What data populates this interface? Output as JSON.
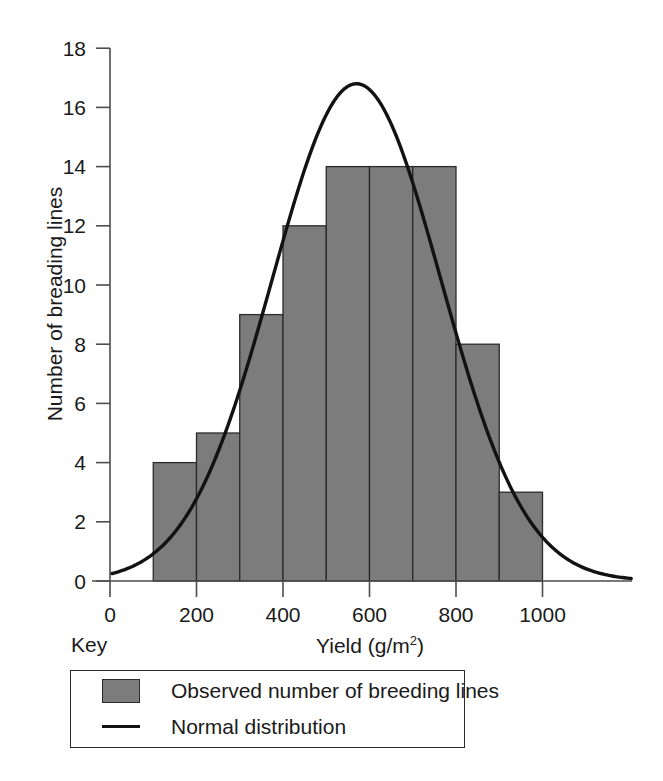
{
  "chart_data": {
    "type": "bar",
    "title": "",
    "subtitle": "",
    "xlabel": "Yield (g/m2)",
    "xlabel_base": "Yield (g/m",
    "xlabel_sup": "2",
    "xlabel_tail": ")",
    "ylabel": "Number of breading lines",
    "xlim": [
      0,
      1100
    ],
    "ylim": [
      0,
      18
    ],
    "grid": false,
    "bin_width": 100,
    "bin_edges": [
      100,
      200,
      300,
      400,
      500,
      600,
      700,
      800,
      900,
      1000
    ],
    "categories": [
      "100-200",
      "200-300",
      "300-400",
      "400-500",
      "500-600",
      "600-700",
      "700-800",
      "800-900",
      "900-1000"
    ],
    "bin_centers": [
      150,
      250,
      350,
      450,
      550,
      650,
      750,
      850,
      950
    ],
    "values": [
      4,
      5,
      9,
      12,
      14,
      14,
      14,
      8,
      3
    ],
    "xticks": [
      0,
      200,
      400,
      600,
      800,
      1000
    ],
    "xtick_labels": [
      "0",
      "200",
      "400",
      "600",
      "800",
      "1000"
    ],
    "yticks": [
      0,
      2,
      4,
      6,
      8,
      10,
      12,
      14,
      16,
      18
    ],
    "ytick_labels": [
      "0",
      "2",
      "4",
      "6",
      "8",
      "10",
      "12",
      "14",
      "16",
      "18"
    ],
    "series": [
      {
        "name": "Observed number of breeding lines",
        "type": "bar",
        "color": "#7c7c7c",
        "values": [
          4,
          5,
          9,
          12,
          14,
          14,
          14,
          8,
          3
        ]
      },
      {
        "name": "Normal distribution",
        "type": "line",
        "color": "#121212",
        "mean": 570,
        "sigma": 195,
        "peak_value": 16.8,
        "x": [
          5,
          100,
          200,
          300,
          400,
          500,
          570,
          600,
          700,
          800,
          900,
          1000,
          1100
        ],
        "y": [
          0.25,
          0.9,
          2.6,
          6.0,
          10.6,
          15.0,
          16.8,
          16.6,
          13.2,
          7.9,
          3.6,
          1.25,
          0.45
        ]
      }
    ],
    "legend_position": "below-left"
  },
  "legend": {
    "key_label": "Key",
    "entries": [
      {
        "marker": "swatch",
        "label": "Observed number of breeding lines"
      },
      {
        "marker": "line",
        "label": "Normal distribution"
      }
    ]
  },
  "colors": {
    "bar_fill": "#7c7c7c",
    "bar_stroke": "#2b2b2b",
    "curve": "#121212",
    "axis": "#4d4d4d",
    "text": "#1a1a1a",
    "background": "#ffffff"
  }
}
